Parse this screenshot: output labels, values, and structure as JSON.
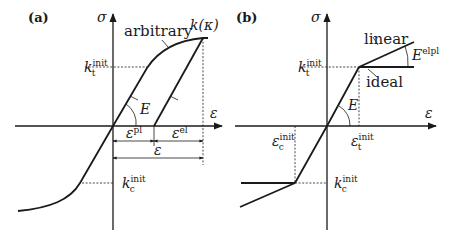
{
  "figure": {
    "panel_a": {
      "label": "(a)",
      "y_axis": "σ",
      "x_axis": "ε",
      "curve_label": "arbitrary",
      "peak_label": "k(κ)",
      "modulus_label": "E",
      "kt": {
        "base": "k",
        "sub": "t",
        "sup": "init"
      },
      "kc": {
        "base": "k",
        "sub": "c",
        "sup": "init"
      },
      "eps_pl": {
        "base": "ε",
        "sup": "pl"
      },
      "eps_el": {
        "base": "ε",
        "sup": "el"
      },
      "eps_total": "ε"
    },
    "panel_b": {
      "label": "(b)",
      "y_axis": "σ",
      "x_axis": "ε",
      "linear_label": "linear",
      "ideal_label": "ideal",
      "modulus_label": "E",
      "elpl": {
        "base": "E",
        "sup": "elpl"
      },
      "kt": {
        "base": "k",
        "sub": "t",
        "sup": "init"
      },
      "kc": {
        "base": "k",
        "sub": "c",
        "sup": "init"
      },
      "eps_t": {
        "base": "ε",
        "sub": "t",
        "sup": "init"
      },
      "eps_c": {
        "base": "ε",
        "sub": "c",
        "sup": "init"
      }
    }
  }
}
